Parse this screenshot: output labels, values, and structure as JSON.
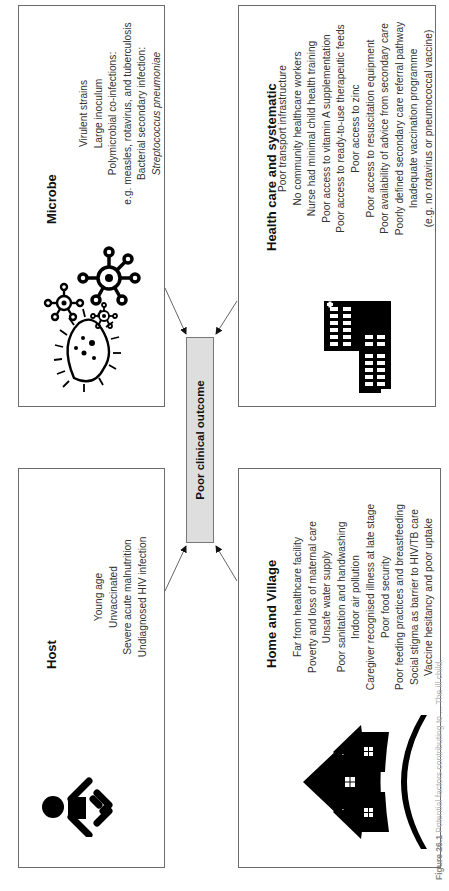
{
  "diagram": {
    "center": {
      "label": "Poor clinical outcome",
      "fill": "#dedede"
    },
    "boxes": {
      "host": {
        "title": "Host",
        "icon": "baby-icon",
        "items": [
          "Young age",
          "Unvaccinated",
          "Severe acute malnutrition",
          "Undiagnosed HIV infection"
        ]
      },
      "microbe": {
        "title": "Microbe",
        "icon": "microbes-icon",
        "items": [
          "Virulent strains",
          "Large inoculum",
          "Polymicrobial co-infections:",
          "e.g. measles, rotavirus, and tuberculosis",
          "Bacterial secondary infection:",
          "Streptococcus pneumoniae"
        ]
      },
      "home": {
        "title": "Home and Village",
        "icon": "village-houses-icon",
        "items": [
          "Far from healthcare facility",
          "Poverty and loss of maternal care",
          "Unsafe water supply",
          "Poor sanitation and handwashing",
          "Indoor air pollution",
          "Caregiver recognised illness at late stage",
          "Poor food security",
          "Poor feeding practices and breastfeeding",
          "Social stigma as barrier to HIV/TB care",
          "Vaccine hesitancy and poor uptake"
        ]
      },
      "health": {
        "title": "Health care and systematic",
        "icon": "hospital-building-icon",
        "items": [
          "Poor transport infrastructure",
          "No community healthcare workers",
          "Nurse had minimal child health training",
          "Poor access to vitamin A supplementation",
          "Poor access to ready-to-use therapeutic feeds",
          "Poor access to zinc",
          "Poor access to resuscitation equipment",
          "Poor availability of advice from secondary care",
          "Poorly defined secondary care referral pathway",
          "Inadequate vaccination programme",
          "(e.g. no rotavirus or pneumococcal vaccine)"
        ]
      }
    },
    "caption": {
      "label": "Figure 26.1",
      "text": "Potential factors contributing to ... The ill child."
    },
    "colors": {
      "border": "#6b6b6b",
      "text": "#333333",
      "icon": "#000000"
    }
  }
}
